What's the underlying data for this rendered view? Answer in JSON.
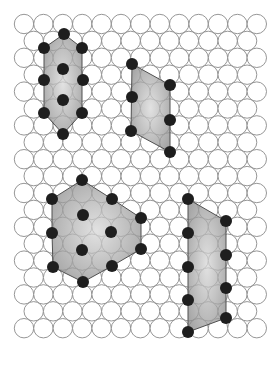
{
  "figure": {
    "width": 279,
    "height": 365,
    "background": "#ffffff",
    "lattice": {
      "type": "hexagonal-close-packed-circles",
      "origin_x": 24,
      "origin_y": 24,
      "pitch_x": 19.4,
      "pitch_y": 16.9,
      "radius": 9.7,
      "rows": 19,
      "cols": 13,
      "stroke": "#8a8a8a",
      "fill": "#ffffff"
    },
    "dot_style": {
      "radius": 6,
      "fill": "#1e1e1e"
    },
    "shape_style": {
      "fill": "#8c8c8c",
      "fill_opacity": 0.55,
      "stroke": "#505050"
    },
    "shapes": [
      {
        "name": "small-hexagonal-cell",
        "polygon": [
          [
            64,
            34
          ],
          [
            82,
            48
          ],
          [
            82,
            113
          ],
          [
            63,
            134
          ],
          [
            44,
            113
          ],
          [
            44,
            48
          ]
        ],
        "dots": [
          [
            64,
            34
          ],
          [
            44,
            48
          ],
          [
            82,
            48
          ],
          [
            63,
            69
          ],
          [
            44,
            80
          ],
          [
            83,
            80
          ],
          [
            63,
            100
          ],
          [
            44,
            113
          ],
          [
            82,
            113
          ],
          [
            63,
            134
          ]
        ]
      },
      {
        "name": "small-parallelogram-cell",
        "polygon": [
          [
            132,
            64
          ],
          [
            170,
            85
          ],
          [
            170,
            152
          ],
          [
            131,
            131
          ]
        ],
        "dots": [
          [
            132,
            64
          ],
          [
            170,
            85
          ],
          [
            132,
            97
          ],
          [
            170,
            120
          ],
          [
            131,
            131
          ],
          [
            170,
            152
          ]
        ]
      },
      {
        "name": "large-hexagonal-cell",
        "polygon": [
          [
            82,
            180
          ],
          [
            112,
            199
          ],
          [
            141,
            218
          ],
          [
            141,
            249
          ],
          [
            112,
            266
          ],
          [
            83,
            282
          ],
          [
            53,
            267
          ],
          [
            52,
            233
          ],
          [
            52,
            199
          ]
        ],
        "dots": [
          [
            82,
            180
          ],
          [
            52,
            199
          ],
          [
            112,
            199
          ],
          [
            83,
            215
          ],
          [
            141,
            218
          ],
          [
            52,
            233
          ],
          [
            111,
            232
          ],
          [
            82,
            250
          ],
          [
            141,
            249
          ],
          [
            53,
            267
          ],
          [
            112,
            266
          ],
          [
            83,
            282
          ]
        ]
      },
      {
        "name": "large-parallelogram-cell",
        "polygon": [
          [
            188,
            199
          ],
          [
            226,
            221
          ],
          [
            226,
            318
          ],
          [
            188,
            332
          ]
        ],
        "dots": [
          [
            188,
            199
          ],
          [
            226,
            221
          ],
          [
            188,
            233
          ],
          [
            226,
            255
          ],
          [
            188,
            267
          ],
          [
            226,
            288
          ],
          [
            188,
            300
          ],
          [
            226,
            318
          ],
          [
            188,
            332
          ]
        ]
      }
    ]
  }
}
